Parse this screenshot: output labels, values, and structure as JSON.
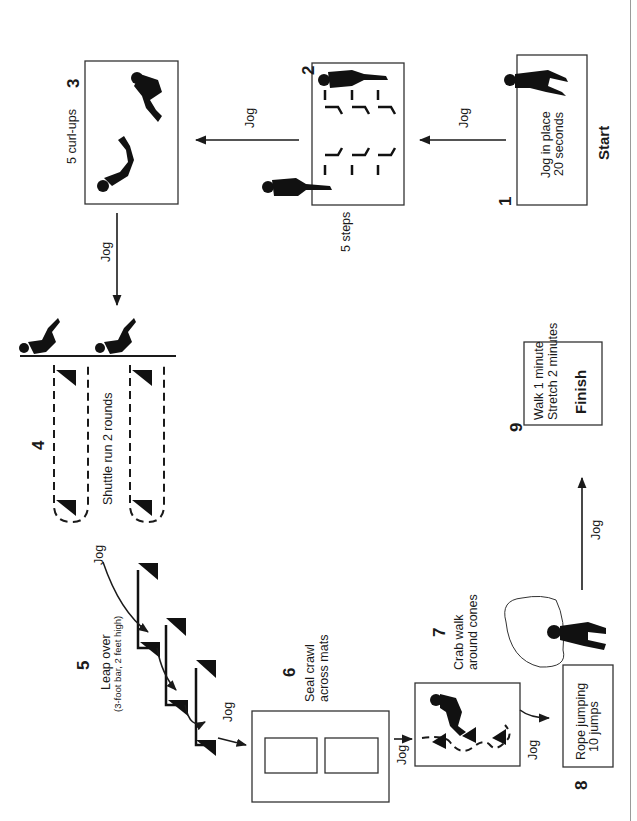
{
  "diagram": {
    "orientation": "rotated-90-ccw",
    "colors": {
      "ink": "#1a1a1a",
      "background": "#ffffff",
      "page_rule": "#9a9a9a"
    },
    "stations": [
      {
        "number": "1",
        "lines": [
          "Jog in place",
          "20 seconds"
        ],
        "tag": "Start",
        "icon": "jogging-person-icon"
      },
      {
        "number": "2",
        "lines": [
          "5 steps"
        ],
        "icon": "step-climbing-person-icon"
      },
      {
        "number": "3",
        "lines": [
          "5 curl-ups"
        ],
        "icon": "curl-up-person-icon"
      },
      {
        "number": "4",
        "lines": [
          "Shuttle run 2 rounds"
        ],
        "icon": "shuttle-runner-icon"
      },
      {
        "number": "5",
        "lines": [
          "Leap over",
          "(3-foot bar, 2 feet high)"
        ],
        "icon": "hurdle-bar-icon"
      },
      {
        "number": "6",
        "lines": [
          "Seal crawl",
          "across mats"
        ],
        "icon": "mat-icon"
      },
      {
        "number": "7",
        "lines": [
          "Crab walk",
          "around cones"
        ],
        "icon": "crab-walk-person-icon"
      },
      {
        "number": "8",
        "lines": [
          "Rope jumping",
          "10 jumps"
        ],
        "icon": "rope-jumper-icon"
      },
      {
        "number": "9",
        "lines": [
          "Walk 1 minute",
          "Stretch 2 minutes"
        ],
        "tag": "Finish"
      }
    ],
    "transitions": [
      {
        "from": "1",
        "to": "2",
        "label": "Jog"
      },
      {
        "from": "2",
        "to": "3",
        "label": "Jog"
      },
      {
        "from": "3",
        "to": "4",
        "label": "Jog"
      },
      {
        "from": "4",
        "to": "5",
        "label": "Jog"
      },
      {
        "from": "5",
        "to": "6",
        "label": "Jog"
      },
      {
        "from": "6",
        "to": "7",
        "label": "Jog"
      },
      {
        "from": "7",
        "to": "8",
        "label": "Jog"
      },
      {
        "from": "8",
        "to": "9",
        "label": "Jog"
      }
    ]
  }
}
